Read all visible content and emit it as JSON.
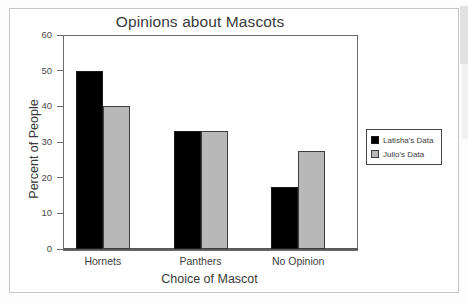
{
  "chart_data": {
    "type": "bar",
    "title": "Opinions about Mascots",
    "xlabel": "Choice of Mascot",
    "ylabel": "Percent of People",
    "categories": [
      "Hornets",
      "Panthers",
      "No Opinion"
    ],
    "series": [
      {
        "name": "Latisha's Data",
        "color": "#000000",
        "values": [
          50,
          33,
          17.5
        ]
      },
      {
        "name": "Julio's Data",
        "color": "#b8b8b8",
        "values": [
          40,
          33,
          27.5
        ]
      }
    ],
    "ylim": [
      0,
      60
    ],
    "yticks": [
      0,
      10,
      20,
      30,
      40,
      50,
      60
    ],
    "ytick_labels": [
      "0",
      "10",
      "20",
      "30",
      "40",
      "50",
      "60"
    ],
    "grid": false,
    "legend_position": "right"
  },
  "legend": {
    "entries": [
      {
        "label": "Latisha's Data"
      },
      {
        "label": "Julio's Data"
      }
    ]
  }
}
